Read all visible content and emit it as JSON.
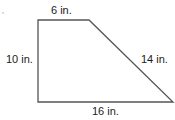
{
  "figure": {
    "shape": "right trapezoid",
    "stroke_color": "#555555",
    "labels": {
      "top": "6 in.",
      "left": "10 in.",
      "slant": "14 in.",
      "bottom": "16 in."
    },
    "vertices": [
      [
        38,
        20
      ],
      [
        89,
        20
      ],
      [
        173,
        102
      ],
      [
        38,
        102
      ]
    ]
  }
}
